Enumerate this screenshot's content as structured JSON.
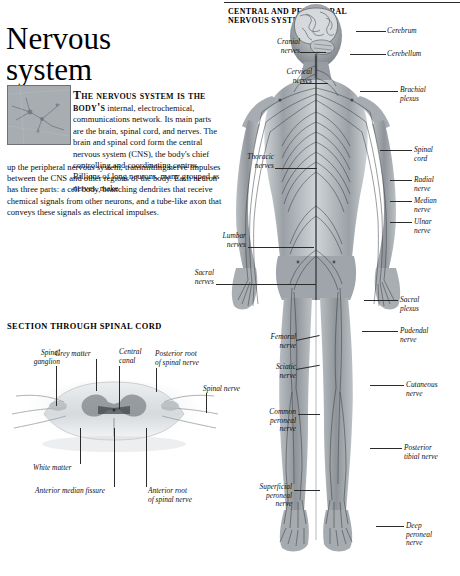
{
  "article": {
    "title_line1": "Nervous",
    "title_line2": "system",
    "intro_lead": "The nervous system is the body's",
    "intro_rest": " internal, electrochemical, communications network. Its main parts are the brain, spinal cord, and nerves. The brain and spinal cord form the central nervous system (CNS), the body's chief controlling and coordinating centres. Billions of long neurons,",
    "intro_indent": " many grouped as nerves, make",
    "body_wide": "up the peripheral nervous system, transmitting nerve impulses between the CNS and other regions of the body. Each neuron has three parts: a cell body, branching dendrites that receive chemical signals from other neurons, and a tube-like axon that conveys these signals as electrical impulses.",
    "thumbnail_alt": "neuron-micrograph"
  },
  "section": {
    "heading": "SECTION THROUGH SPINAL CORD",
    "labels": [
      {
        "name": "spinal-ganglion",
        "text": "Spinal\nganglion"
      },
      {
        "name": "grey-matter",
        "text": "Grey matter"
      },
      {
        "name": "central-canal",
        "text": "Central\ncanal"
      },
      {
        "name": "posterior-root-spinal-nerve",
        "text": "Posterior root\nof spinal nerve"
      },
      {
        "name": "spinal-nerve",
        "text": "Spinal nerve"
      },
      {
        "name": "white-matter",
        "text": "White matter"
      },
      {
        "name": "anterior-median-fissure",
        "text": "Anterior median fissure"
      },
      {
        "name": "anterior-root-spinal-nerve",
        "text": "Anterior root\nof spinal nerve"
      }
    ]
  },
  "figure": {
    "heading_line1": "CENTRAL AND PERIPHERAL",
    "heading_line2": "NERVOUS SYSTEMS",
    "labels_right": [
      {
        "name": "cerebrum",
        "text": "Cerebrum"
      },
      {
        "name": "cerebellum",
        "text": "Cerebellum"
      },
      {
        "name": "brachial-plexus",
        "text": "Brachial\nplexus"
      },
      {
        "name": "spinal-cord",
        "text": "Spinal\ncord"
      },
      {
        "name": "radial-nerve",
        "text": "Radial\nnerve"
      },
      {
        "name": "median-nerve",
        "text": "Median\nnerve"
      },
      {
        "name": "ulnar-nerve",
        "text": "Ulnar\nnerve"
      },
      {
        "name": "sacral-plexus",
        "text": "Sacral\nplexus"
      },
      {
        "name": "pudendal-nerve",
        "text": "Pudendal\nnerve"
      },
      {
        "name": "cutaneous-nerve",
        "text": "Cutaneous\nnerve"
      },
      {
        "name": "posterior-tibial-nerve",
        "text": "Posterior\ntibial nerve"
      },
      {
        "name": "deep-peroneal-nerve",
        "text": "Deep\nperoneal\nnerve"
      }
    ],
    "labels_left": [
      {
        "name": "cranial-nerves",
        "text": "Cranial\nnerves"
      },
      {
        "name": "cervical-nerves",
        "text": "Cervical\nnerves"
      },
      {
        "name": "thoracic-nerves",
        "text": "Thoracic\nnerves"
      },
      {
        "name": "lumbar-nerves",
        "text": "Lumbar\nnerves"
      },
      {
        "name": "sacral-nerves",
        "text": "Sacral\nnerves"
      },
      {
        "name": "femoral-nerve",
        "text": "Femoral\nnerve"
      },
      {
        "name": "sciatic-nerve",
        "text": "Sciatic\nnerve"
      },
      {
        "name": "common-peroneal-nerve",
        "text": "Common\nperoneal\nnerve"
      },
      {
        "name": "superficial-peroneal-nerve",
        "text": "Superficial\nperoneal\nnerve"
      }
    ]
  },
  "colors": {
    "page_background": "#ffffff",
    "text": "#111111",
    "rule": "#2a2a2a",
    "figure_mid": "#8d9397",
    "figure_dark": "#3a3f43"
  }
}
